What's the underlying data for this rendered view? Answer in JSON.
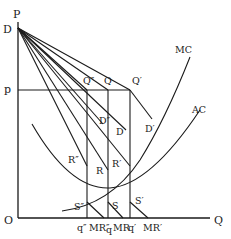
{
  "diagram": {
    "type": "economics-cost-demand-diagram",
    "axes": {
      "y_label": "P",
      "x_label": "Q",
      "origin_label": "O"
    },
    "price_level_label": "p",
    "demand_intercept_label": "D",
    "points": {
      "q_double_prime_top": "Q″",
      "q_top": "Q",
      "q_prime_top": "Q′",
      "r_double_prime": "R″",
      "r": "R",
      "r_prime": "R′",
      "s_double_prime": "S″",
      "s": "S",
      "s_prime": "S′"
    },
    "demand_curves": {
      "d_double_prime": "D″",
      "d": "D",
      "d_prime": "D′"
    },
    "cost_curves": {
      "mc": "MC",
      "ac": "AC"
    },
    "quantity_ticks": {
      "q_double_prime": "q″",
      "mr_double_prime": "MR″",
      "q": "q",
      "mr": "MR",
      "q_prime": "q′",
      "mr_prime": "MR′"
    }
  }
}
